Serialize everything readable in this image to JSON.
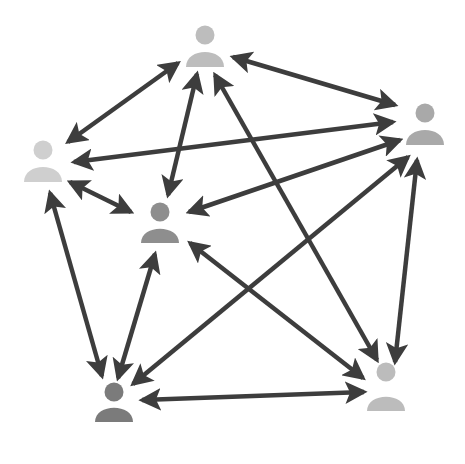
{
  "diagram": {
    "type": "network",
    "arrow_color": "#3d3d3d",
    "arrow_width": 4.5,
    "nodes": [
      {
        "id": "top",
        "cx": 205,
        "head_cy": 35,
        "body_top": 48,
        "body_bottom": 67,
        "color": "#bdbdbd"
      },
      {
        "id": "right",
        "cx": 425,
        "head_cy": 113,
        "body_top": 126,
        "body_bottom": 145,
        "color": "#a9a9a9"
      },
      {
        "id": "left",
        "cx": 43,
        "head_cy": 150,
        "body_top": 163,
        "body_bottom": 182,
        "color": "#cfcfcf"
      },
      {
        "id": "center",
        "cx": 160,
        "head_cy": 212,
        "body_top": 225,
        "body_bottom": 243,
        "color": "#8e8e8e"
      },
      {
        "id": "bottom-left",
        "cx": 114,
        "head_cy": 392,
        "body_top": 404,
        "body_bottom": 422,
        "color": "#7b7b7b"
      },
      {
        "id": "bottom-right",
        "cx": 386,
        "head_cy": 372,
        "body_top": 393,
        "body_bottom": 411,
        "color": "#bcbcbc"
      }
    ],
    "edges": [
      {
        "from": "top",
        "to": "left",
        "x1": 178,
        "y1": 63,
        "x2": 68,
        "y2": 142
      },
      {
        "from": "top",
        "to": "right",
        "x1": 233,
        "y1": 57,
        "x2": 395,
        "y2": 105
      },
      {
        "from": "top",
        "to": "center",
        "x1": 197,
        "y1": 74,
        "x2": 168,
        "y2": 195
      },
      {
        "from": "top",
        "to": "bottom-right",
        "x1": 215,
        "y1": 75,
        "x2": 377,
        "y2": 360
      },
      {
        "from": "left",
        "to": "right",
        "x1": 74,
        "y1": 162,
        "x2": 393,
        "y2": 122
      },
      {
        "from": "left",
        "to": "center",
        "x1": 70,
        "y1": 182,
        "x2": 131,
        "y2": 212
      },
      {
        "from": "left",
        "to": "bottom-left",
        "x1": 50,
        "y1": 193,
        "x2": 102,
        "y2": 376
      },
      {
        "from": "right",
        "to": "center",
        "x1": 400,
        "y1": 140,
        "x2": 189,
        "y2": 212
      },
      {
        "from": "right",
        "to": "bottom-left",
        "x1": 408,
        "y1": 157,
        "x2": 133,
        "y2": 384
      },
      {
        "from": "right",
        "to": "bottom-right",
        "x1": 417,
        "y1": 160,
        "x2": 395,
        "y2": 362
      },
      {
        "from": "center",
        "to": "bottom-left",
        "x1": 155,
        "y1": 254,
        "x2": 118,
        "y2": 378
      },
      {
        "from": "center",
        "to": "bottom-right",
        "x1": 190,
        "y1": 243,
        "x2": 363,
        "y2": 378
      },
      {
        "from": "bottom-left",
        "to": "bottom-right",
        "x1": 142,
        "y1": 400,
        "x2": 364,
        "y2": 392
      }
    ]
  }
}
